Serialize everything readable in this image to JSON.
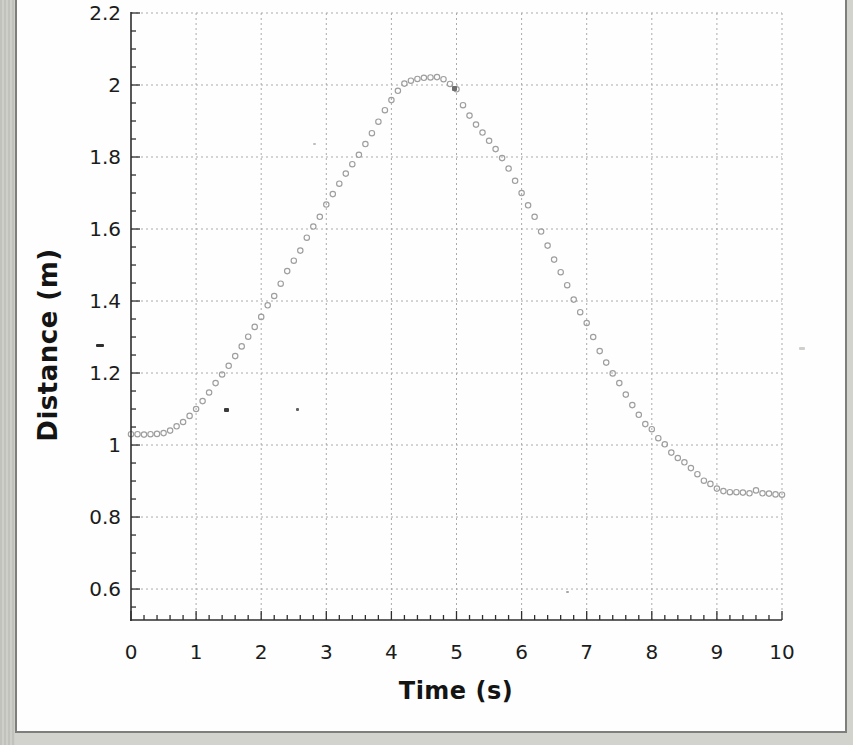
{
  "page": {
    "outer_background": "#d3d3ce",
    "paper_color": "#fefefe",
    "frame_color": "#7e7e7c"
  },
  "chart_data": {
    "type": "scatter",
    "title": "",
    "xlabel": "Time (s)",
    "ylabel": "Distance (m)",
    "xlim": [
      0,
      10
    ],
    "ylim": [
      0.514,
      2.2
    ],
    "grid": "dashed",
    "grid_color": "#ababab",
    "axis_color": "#2e2e2e",
    "legend": "none",
    "marker": "open-circle",
    "marker_color": "#9e9e9e",
    "x_ticks": [
      0,
      1,
      2,
      3,
      4,
      5,
      6,
      7,
      8,
      9,
      10
    ],
    "x_tick_labels": [
      "0",
      "1",
      "2",
      "3",
      "4",
      "5",
      "6",
      "7",
      "8",
      "9",
      "10"
    ],
    "x_minor_step": 0.2,
    "y_ticks": [
      0.6,
      0.8,
      1.0,
      1.2,
      1.4,
      1.6,
      1.8,
      2.0,
      2.2
    ],
    "y_tick_labels": [
      "0.6",
      "0.8",
      "1",
      "1.2",
      "1.4",
      "1.6",
      "1.8",
      "2",
      "2.2"
    ],
    "y_minor_step": 0.05,
    "x_start": 0,
    "x_step": 0.1,
    "x": [
      0,
      0.1,
      0.2,
      0.3,
      0.4,
      0.5,
      0.6,
      0.7,
      0.8,
      0.9,
      1,
      1.1,
      1.2,
      1.3,
      1.4,
      1.5,
      1.6,
      1.7,
      1.8,
      1.9,
      2,
      2.1,
      2.2,
      2.3,
      2.4,
      2.5,
      2.6,
      2.7,
      2.8,
      2.9,
      3,
      3.1,
      3.2,
      3.3,
      3.4,
      3.5,
      3.6,
      3.7,
      3.8,
      3.9,
      4,
      4.1,
      4.2,
      4.3,
      4.4,
      4.5,
      4.6,
      4.7,
      4.8,
      4.9,
      5,
      5.1,
      5.2,
      5.3,
      5.4,
      5.5,
      5.6,
      5.7,
      5.8,
      5.9,
      6,
      6.1,
      6.2,
      6.3,
      6.4,
      6.5,
      6.6,
      6.7,
      6.8,
      6.9,
      7,
      7.1,
      7.2,
      7.3,
      7.4,
      7.5,
      7.6,
      7.7,
      7.8,
      7.9,
      8,
      8.1,
      8.2,
      8.3,
      8.4,
      8.5,
      8.6,
      8.7,
      8.8,
      8.9,
      9,
      9.1,
      9.2,
      9.3,
      9.4,
      9.5,
      9.6,
      9.7,
      9.8,
      9.9,
      10
    ],
    "y": [
      1.03,
      1.03,
      1.029,
      1.03,
      1.031,
      1.033,
      1.04,
      1.052,
      1.064,
      1.081,
      1.1,
      1.122,
      1.146,
      1.172,
      1.196,
      1.22,
      1.247,
      1.274,
      1.301,
      1.328,
      1.356,
      1.388,
      1.414,
      1.448,
      1.483,
      1.512,
      1.54,
      1.576,
      1.607,
      1.634,
      1.668,
      1.697,
      1.726,
      1.754,
      1.78,
      1.806,
      1.836,
      1.866,
      1.898,
      1.93,
      1.958,
      1.984,
      2.004,
      2.012,
      2.017,
      2.02,
      2.021,
      2.022,
      2.016,
      2.003,
      1.988,
      1.944,
      1.915,
      1.89,
      1.868,
      1.845,
      1.822,
      1.797,
      1.768,
      1.734,
      1.7,
      1.666,
      1.634,
      1.593,
      1.554,
      1.515,
      1.48,
      1.444,
      1.404,
      1.369,
      1.339,
      1.3,
      1.261,
      1.229,
      1.199,
      1.172,
      1.14,
      1.111,
      1.084,
      1.058,
      1.044,
      1.019,
      1.002,
      0.979,
      0.964,
      0.952,
      0.936,
      0.919,
      0.901,
      0.892,
      0.879,
      0.872,
      0.869,
      0.869,
      0.868,
      0.866,
      0.874,
      0.866,
      0.865,
      0.863,
      0.862
    ]
  },
  "artifacts": [
    {
      "x": 96,
      "y": 344,
      "w": 8,
      "h": 3,
      "color": "#2f2f2f"
    },
    {
      "x": 224,
      "y": 408,
      "w": 5,
      "h": 4,
      "color": "#3a3a3a"
    },
    {
      "x": 296,
      "y": 408,
      "w": 3,
      "h": 3,
      "color": "#606060"
    },
    {
      "x": 452,
      "y": 86,
      "w": 5,
      "h": 5,
      "color": "#6d6d6d"
    },
    {
      "x": 313,
      "y": 143,
      "w": 3,
      "h": 2,
      "color": "#bdbdbd"
    },
    {
      "x": 799,
      "y": 347,
      "w": 6,
      "h": 3,
      "color": "#cfcfcb"
    },
    {
      "x": 566,
      "y": 591,
      "w": 3,
      "h": 2,
      "color": "#a5a5a2"
    }
  ]
}
